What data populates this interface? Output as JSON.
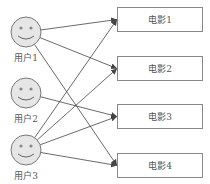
{
  "users": [
    {
      "label": "用户1",
      "cx": 26,
      "cy": 32
    },
    {
      "label": "用户2",
      "cx": 26,
      "cy": 93
    },
    {
      "label": "用户3",
      "cx": 26,
      "cy": 150
    }
  ],
  "movies": [
    {
      "label": "电影1",
      "x": 117,
      "y": 7,
      "w": 86,
      "h": 25
    },
    {
      "label": "电影2",
      "x": 117,
      "y": 56,
      "w": 86,
      "h": 25
    },
    {
      "label": "电影3",
      "x": 117,
      "y": 104,
      "w": 86,
      "h": 25
    },
    {
      "label": "电影4",
      "x": 117,
      "y": 153,
      "w": 86,
      "h": 25
    }
  ],
  "edges": [
    {
      "from": 0,
      "to": 0
    },
    {
      "from": 0,
      "to": 1
    },
    {
      "from": 0,
      "to": 3
    },
    {
      "from": 1,
      "to": 2
    },
    {
      "from": 2,
      "to": 0
    },
    {
      "from": 2,
      "to": 1
    },
    {
      "from": 2,
      "to": 2
    },
    {
      "from": 2,
      "to": 3
    }
  ],
  "colors": {
    "face_fill": "#e6e6e6",
    "stroke": "#777777",
    "line": "#444444"
  }
}
